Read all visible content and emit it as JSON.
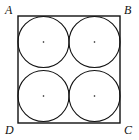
{
  "diagram": {
    "title": "",
    "square": {
      "x": 18,
      "y": 16,
      "width": 102,
      "height": 107,
      "stroke": "#111111"
    },
    "labels": [
      {
        "text": "A",
        "x": 5,
        "y": 14
      },
      {
        "text": "B",
        "x": 124,
        "y": 14
      },
      {
        "text": "C",
        "x": 124,
        "y": 134
      },
      {
        "text": "D",
        "x": 5,
        "y": 134
      }
    ],
    "circles": [
      {
        "cx": 43.5,
        "cy": 42,
        "r": 25.5
      },
      {
        "cx": 94.5,
        "cy": 42,
        "r": 25.5
      },
      {
        "cx": 43.5,
        "cy": 96,
        "r": 25.5
      },
      {
        "cx": 94.5,
        "cy": 96,
        "r": 25.5
      }
    ]
  }
}
